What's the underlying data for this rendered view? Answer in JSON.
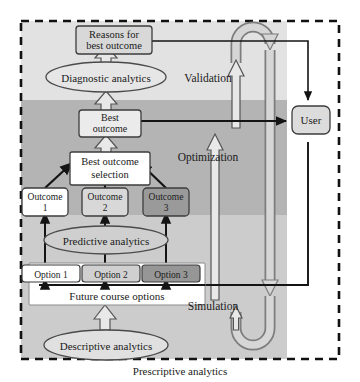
{
  "figure": {
    "caption": "Prescriptive analytics",
    "border_style": "dashed"
  },
  "bands": {
    "top_label": "light-band",
    "middle_label": "dark-band",
    "bottom_label": "mid-band",
    "colors": {
      "light": "#e2e2e2",
      "dark": "#b4b4b4",
      "mid": "#cccccc",
      "white": "#ffffff"
    }
  },
  "palette": {
    "box_white": "#ffffff",
    "box_light": "#d8d8d8",
    "box_dark": "#9a9a9a",
    "arrow_fill": "#e8e8e8",
    "stroke": "#1a1a1a",
    "thin_stroke": "#404040"
  },
  "nodes": {
    "reasons": {
      "line1": "Reasons for",
      "line2": "best outcome"
    },
    "diagnostic": {
      "label": "Diagnostic analytics"
    },
    "best_outcome": {
      "line1": "Best",
      "line2": "outcome"
    },
    "best_outcome_selection": {
      "line1": "Best outcome",
      "line2": "selection"
    },
    "outcomes": [
      {
        "line1": "Outcome",
        "line2": "1",
        "shade": "white"
      },
      {
        "line1": "Outcome",
        "line2": "2",
        "shade": "light"
      },
      {
        "line1": "Outcome",
        "line2": "3",
        "shade": "dark"
      }
    ],
    "predictive": {
      "label": "Predictive analytics"
    },
    "options": [
      {
        "label": "Option 1",
        "shade": "white"
      },
      {
        "label": "Option 2",
        "shade": "light"
      },
      {
        "label": "Option 3",
        "shade": "dark"
      }
    ],
    "future_course_options": {
      "label": "Future course options"
    },
    "descriptive": {
      "label": "Descriptive analytics"
    },
    "user": {
      "label": "User"
    }
  },
  "flow_labels": {
    "validation": "Validation",
    "optimization": "Optimization",
    "simulation": "Simulation"
  }
}
